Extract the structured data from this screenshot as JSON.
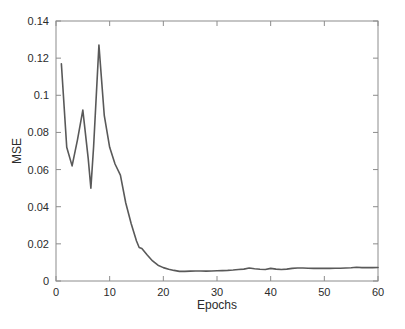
{
  "chart_data": {
    "type": "line",
    "title": "",
    "xlabel": "Epochs",
    "ylabel": "MSE",
    "xlim": [
      0,
      60
    ],
    "ylim": [
      0,
      0.14
    ],
    "grid": false,
    "legend": null,
    "line_color": "#595959",
    "line_width": 1.6,
    "xticks": [
      0,
      10,
      20,
      30,
      40,
      50,
      60
    ],
    "xtick_labels": [
      "0",
      "10",
      "20",
      "30",
      "40",
      "50",
      "60"
    ],
    "yticks": [
      0,
      0.02,
      0.04,
      0.06,
      0.08,
      0.1,
      0.12,
      0.14
    ],
    "ytick_labels": [
      "0",
      "0.02",
      "0.04",
      "0.06",
      "0.08",
      "0.1",
      "0.12",
      "0.14"
    ],
    "series": [
      {
        "name": "MSE",
        "x": [
          1,
          2,
          3,
          4,
          5,
          6,
          6.5,
          7,
          8,
          9,
          10,
          11,
          12,
          13,
          14,
          15,
          15.5,
          16,
          17,
          18,
          19,
          20,
          21,
          22,
          23,
          24,
          25,
          26,
          27,
          28,
          29,
          30,
          31,
          32,
          33,
          34,
          35,
          36,
          37,
          38,
          39,
          40,
          41,
          42,
          43,
          44,
          45,
          46,
          47,
          48,
          49,
          50,
          51,
          52,
          53,
          54,
          55,
          56,
          57,
          58,
          59,
          60
        ],
        "y": [
          0.117,
          0.072,
          0.062,
          0.076,
          0.092,
          0.066,
          0.05,
          0.072,
          0.127,
          0.089,
          0.072,
          0.063,
          0.057,
          0.042,
          0.031,
          0.0215,
          0.018,
          0.0175,
          0.014,
          0.0108,
          0.0085,
          0.0072,
          0.0063,
          0.0057,
          0.0052,
          0.0052,
          0.0053,
          0.0054,
          0.0054,
          0.0053,
          0.0054,
          0.0055,
          0.0056,
          0.0057,
          0.0059,
          0.0062,
          0.0064,
          0.007,
          0.0066,
          0.0063,
          0.0062,
          0.0068,
          0.0064,
          0.0062,
          0.0064,
          0.0068,
          0.007,
          0.007,
          0.0069,
          0.0068,
          0.0068,
          0.0069,
          0.0068,
          0.0069,
          0.0069,
          0.007,
          0.0071,
          0.0074,
          0.0072,
          0.0072,
          0.0072,
          0.0073
        ]
      }
    ]
  },
  "figure": {
    "background": "#ffffff",
    "axis_color": "#8c8c8c"
  }
}
